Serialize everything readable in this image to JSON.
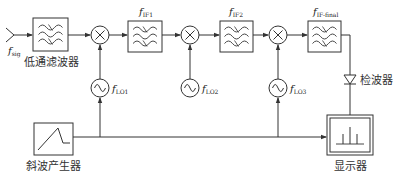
{
  "diagram": {
    "type": "superheterodyne spectrum analyzer block diagram",
    "colors": {
      "stroke": "#333333",
      "background": "#ffffff"
    },
    "input": {
      "symbol": "f",
      "sub": "sig"
    },
    "blocks": {
      "lowpass": {
        "label": "低通滤波器"
      },
      "if1": {
        "symbol": "f",
        "sub": "IF1"
      },
      "if2": {
        "symbol": "f",
        "sub": "IF2"
      },
      "iffinal": {
        "symbol": "f",
        "sub": "IF-final"
      },
      "detector": {
        "label": "检波器"
      },
      "display": {
        "label": "显示器"
      },
      "ramp": {
        "label": "斜波产生器"
      }
    },
    "oscillators": {
      "lo1": {
        "symbol": "f",
        "sub": "LO1"
      },
      "lo2": {
        "symbol": "f",
        "sub": "LO2"
      },
      "lo3": {
        "symbol": "f",
        "sub": "LO3"
      }
    },
    "mixers": [
      "mixer-1",
      "mixer-2",
      "mixer-3"
    ]
  }
}
